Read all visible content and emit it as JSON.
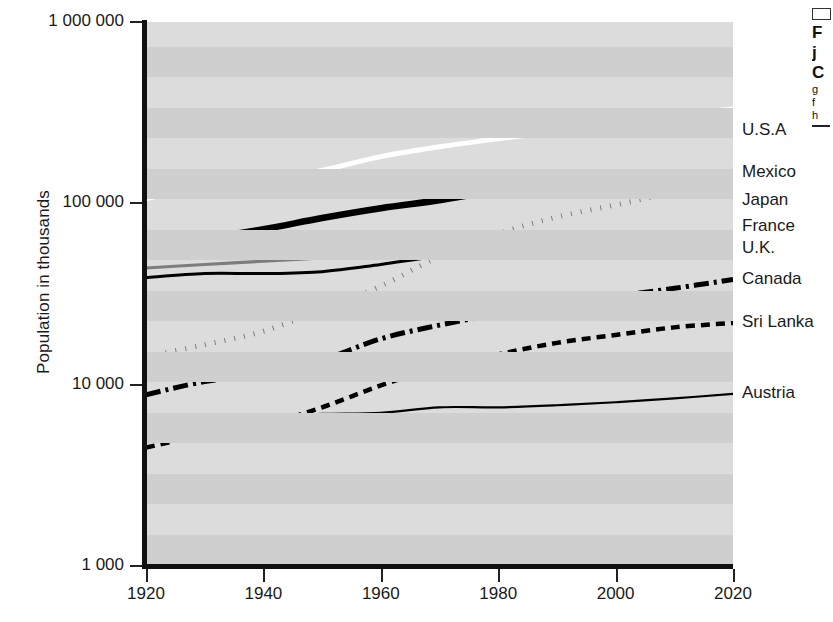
{
  "axes": {
    "ylabel": "Population in thousands",
    "ytick_labels": [
      "1 000 000",
      "100 000",
      "10 000",
      "1 000"
    ],
    "ytick_values": [
      1000000,
      100000,
      10000,
      1000
    ],
    "xtick_labels": [
      "1920",
      "1940",
      "1960",
      "1980",
      "2000",
      "2020"
    ],
    "xtick_values": [
      1920,
      1940,
      1960,
      1980,
      2000,
      2020
    ]
  },
  "series_labels": [
    "U.S.A",
    "Mexico",
    "Japan",
    "France",
    "U.K.",
    "Canada",
    "Sri Lanka",
    "Austria"
  ],
  "side_caption": {
    "box": "",
    "line1": "F",
    "line2": "j",
    "line3": "C",
    "line4": "g",
    "line5": "f",
    "line6": "h"
  },
  "colors": {
    "plot_background": "#dcdcdc",
    "stripe": "#cfcfcf",
    "axis": "#111111",
    "usa_line": "#ffffff",
    "japan_line": "#000000",
    "france_line": "#000000",
    "uk_line": "#7d7d7d",
    "mexico_line": "#7d7d7d",
    "canada_line": "#000000",
    "srilanka_line": "#000000",
    "austria_line": "#000000"
  },
  "chart_data": {
    "type": "line",
    "title": "",
    "xlabel": "",
    "ylabel": "Population in thousands",
    "yscale": "log",
    "xlim": [
      1920,
      2020
    ],
    "ylim": [
      1000,
      1000000
    ],
    "grid": "horizontal-bands",
    "legend": "right-side inline labels",
    "x": [
      1920,
      1930,
      1940,
      1950,
      1960,
      1970,
      1980,
      1990,
      2000,
      2010,
      2020
    ],
    "series": [
      {
        "name": "U.S.A",
        "style": "solid-white-thick",
        "values": [
          106000,
          123000,
          132000,
          152000,
          181000,
          205000,
          227000,
          249000,
          282000,
          309000,
          331000
        ]
      },
      {
        "name": "Japan",
        "style": "solid-black-verythick",
        "values": [
          56000,
          64000,
          72000,
          83000,
          94000,
          104000,
          117000,
          123000,
          127000,
          128000,
          126000
        ]
      },
      {
        "name": "France",
        "style": "solid-black-thin",
        "values": [
          39000,
          41000,
          41000,
          42000,
          46000,
          51000,
          54000,
          57000,
          59000,
          63000,
          65000
        ]
      },
      {
        "name": "U.K.",
        "style": "solid-gray-medium",
        "values": [
          44000,
          46000,
          48000,
          50000,
          52000,
          55000,
          56000,
          57000,
          59000,
          63000,
          67000
        ]
      },
      {
        "name": "Mexico",
        "style": "dotted-gray",
        "values": [
          14300,
          16600,
          19700,
          26000,
          35000,
          51000,
          68000,
          84000,
          98000,
          114000,
          126000
        ]
      },
      {
        "name": "Canada",
        "style": "dash-dot-black",
        "values": [
          8800,
          10400,
          11400,
          13700,
          17900,
          21300,
          24500,
          27700,
          30700,
          34000,
          38000
        ]
      },
      {
        "name": "Sri Lanka",
        "style": "dashed-black",
        "values": [
          4500,
          5300,
          6000,
          7500,
          9900,
          12500,
          14700,
          17000,
          18800,
          20700,
          21900
        ]
      },
      {
        "name": "Austria",
        "style": "solid-black-thin",
        "values": [
          6500,
          6700,
          6700,
          6900,
          7000,
          7500,
          7500,
          7700,
          8000,
          8400,
          8900
        ]
      }
    ]
  }
}
